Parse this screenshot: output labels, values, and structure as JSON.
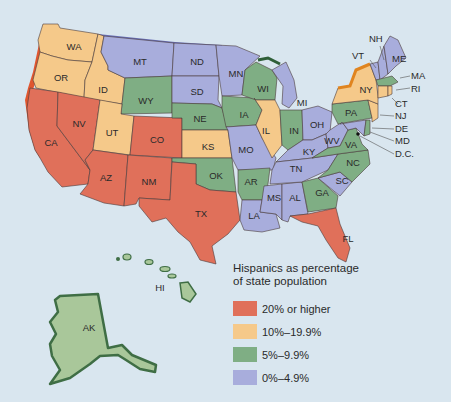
{
  "legend": {
    "title_line1": "Hispanics as percentage",
    "title_line2": "of state population",
    "items": [
      {
        "label": "20% or higher",
        "color": "#e0705a"
      },
      {
        "label": "10%–19.9%",
        "color": "#f5c98a"
      },
      {
        "label": "5%–9.9%",
        "color": "#7fae84"
      },
      {
        "label": "0%–4.9%",
        "color": "#a8addc"
      }
    ]
  },
  "colors": {
    "background": "#d9e6ef",
    "cat_20plus": "#e0705a",
    "cat_10_19": "#f5c98a",
    "cat_5_9": "#7fae84",
    "cat_0_4": "#a8addc",
    "alaska_hawaii": "#a9c79a",
    "shadow_green": "#3f6e45"
  },
  "states": {
    "WA": {
      "label": "WA",
      "category": "10%–19.9%"
    },
    "OR": {
      "label": "OR",
      "category": "10%–19.9%"
    },
    "ID": {
      "label": "ID",
      "category": "10%–19.9%"
    },
    "MT": {
      "label": "MT",
      "category": "0%–4.9%"
    },
    "ND": {
      "label": "ND",
      "category": "0%–4.9%"
    },
    "SD": {
      "label": "SD",
      "category": "0%–4.9%"
    },
    "MN": {
      "label": "MN",
      "category": "0%–4.9%"
    },
    "WY": {
      "label": "WY",
      "category": "5%–9.9%"
    },
    "NE": {
      "label": "NE",
      "category": "5%–9.9%"
    },
    "IA": {
      "label": "IA",
      "category": "5%–9.9%"
    },
    "WI": {
      "label": "WI",
      "category": "5%–9.9%"
    },
    "MI": {
      "label": "MI",
      "category": "0%–4.9%"
    },
    "CA": {
      "label": "CA",
      "category": "20% or higher"
    },
    "NV": {
      "label": "NV",
      "category": "20% or higher"
    },
    "UT": {
      "label": "UT",
      "category": "10%–19.9%"
    },
    "CO": {
      "label": "CO",
      "category": "20% or higher"
    },
    "KS": {
      "label": "KS",
      "category": "10%–19.9%"
    },
    "MO": {
      "label": "MO",
      "category": "0%–4.9%"
    },
    "IL": {
      "label": "IL",
      "category": "10%–19.9%"
    },
    "IN": {
      "label": "IN",
      "category": "5%–9.9%"
    },
    "OH": {
      "label": "OH",
      "category": "0%–4.9%"
    },
    "KY": {
      "label": "KY",
      "category": "0%–4.9%"
    },
    "WV": {
      "label": "WV",
      "category": "0%–4.9%"
    },
    "VA": {
      "label": "VA",
      "category": "5%–9.9%"
    },
    "PA": {
      "label": "PA",
      "category": "5%–9.9%"
    },
    "NY": {
      "label": "NY",
      "category": "10%–19.9%"
    },
    "VT": {
      "label": "VT",
      "category": "0%–4.9%"
    },
    "NH": {
      "label": "NH",
      "category": "0%–4.9%"
    },
    "ME": {
      "label": "ME",
      "category": "0%–4.9%"
    },
    "MA": {
      "label": "MA",
      "category": "5%–9.9%"
    },
    "RI": {
      "label": "RI",
      "category": "10%–19.9%"
    },
    "CT": {
      "label": "CT",
      "category": "10%–19.9%"
    },
    "NJ": {
      "label": "NJ",
      "category": "10%–19.9%"
    },
    "DE": {
      "label": "DE",
      "category": "5%–9.9%"
    },
    "MD": {
      "label": "MD",
      "category": "5%–9.9%"
    },
    "DC": {
      "label": "D.C.",
      "category": "5%–9.9%"
    },
    "AZ": {
      "label": "AZ",
      "category": "20% or higher"
    },
    "NM": {
      "label": "NM",
      "category": "20% or higher"
    },
    "TX": {
      "label": "TX",
      "category": "20% or higher"
    },
    "OK": {
      "label": "OK",
      "category": "5%–9.9%"
    },
    "AR": {
      "label": "AR",
      "category": "5%–9.9%"
    },
    "TN": {
      "label": "TN",
      "category": "0%–4.9%"
    },
    "NC": {
      "label": "NC",
      "category": "5%–9.9%"
    },
    "SC": {
      "label": "SC",
      "category": "0%–4.9%"
    },
    "GA": {
      "label": "GA",
      "category": "5%–9.9%"
    },
    "AL": {
      "label": "AL",
      "category": "0%–4.9%"
    },
    "MS": {
      "label": "MS",
      "category": "0%–4.9%"
    },
    "LA": {
      "label": "LA",
      "category": "0%–4.9%"
    },
    "FL": {
      "label": "FL",
      "category": "20% or higher"
    },
    "AK": {
      "label": "AK",
      "category": "5%–9.9%"
    },
    "HI": {
      "label": "HI",
      "category": "5%–9.9%"
    }
  }
}
